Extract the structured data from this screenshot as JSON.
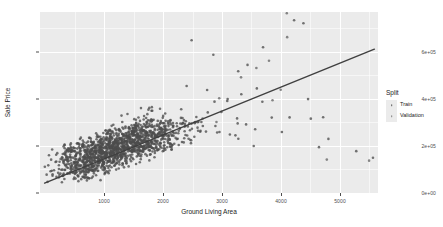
{
  "chart_data": {
    "type": "scatter",
    "title": "",
    "xlabel": "Ground Living Area",
    "ylabel": "Sale Price",
    "xlim": [
      260,
      5700
    ],
    "ylim": [
      0,
      770000
    ],
    "grid": true,
    "x_ticks": [
      1000,
      2000,
      3000,
      4000,
      5000
    ],
    "x_tick_labels": [
      "1000",
      "2000",
      "3000",
      "4000",
      "5000"
    ],
    "x_minor_ticks": [
      500,
      1500,
      2500,
      3500,
      4500,
      5500
    ],
    "y_ticks": [
      0,
      200000,
      400000,
      600000
    ],
    "y_tick_labels": [
      "0e+00",
      "2e+05",
      "4e+05",
      "6e+05"
    ],
    "y_minor_ticks": [
      100000,
      300000,
      500000,
      700000
    ],
    "legend": {
      "title": "Split",
      "position": "right",
      "entries": [
        {
          "label": "Train",
          "color": "#595959",
          "marker": "point"
        },
        {
          "label": "Validation",
          "color": "#7f7f7f",
          "marker": "point"
        }
      ]
    },
    "trend_line": {
      "type": "linear",
      "color": "#404040",
      "x_start": 334,
      "y_start": 42000,
      "x_end": 5642,
      "y_end": 612000
    },
    "point_color": "#4d4d4d",
    "point_size": 1.3,
    "series": [
      {
        "name": "Train",
        "color": "#4d4d4d",
        "points": [
          [
            334,
            40000
          ],
          [
            360,
            55000
          ],
          [
            438,
            60000
          ],
          [
            480,
            68000
          ],
          [
            520,
            76000
          ],
          [
            547,
            82000
          ],
          [
            572,
            88000
          ],
          [
            600,
            72000
          ],
          [
            616,
            95000
          ],
          [
            630,
            101000
          ],
          [
            648,
            86000
          ],
          [
            660,
            112000
          ],
          [
            672,
            97000
          ],
          [
            686,
            120000
          ],
          [
            700,
            105000
          ],
          [
            712,
            130000
          ],
          [
            720,
            90000
          ],
          [
            730,
            115000
          ],
          [
            740,
            126000
          ],
          [
            748,
            108000
          ],
          [
            756,
            137000
          ],
          [
            764,
            119000
          ],
          [
            772,
            143000
          ],
          [
            780,
            95000
          ],
          [
            788,
            128000
          ],
          [
            796,
            152000
          ],
          [
            804,
            110000
          ],
          [
            812,
            135000
          ],
          [
            820,
            122000
          ],
          [
            828,
            148000
          ],
          [
            836,
            113000
          ],
          [
            844,
            160000
          ],
          [
            852,
            131000
          ],
          [
            860,
            102000
          ],
          [
            868,
            142000
          ],
          [
            876,
            155000
          ],
          [
            884,
            124000
          ],
          [
            892,
            118000
          ],
          [
            900,
            137000
          ],
          [
            908,
            165000
          ],
          [
            912,
            109000
          ],
          [
            920,
            129000
          ],
          [
            928,
            146000
          ],
          [
            936,
            133000
          ],
          [
            944,
            158000
          ],
          [
            952,
            120000
          ],
          [
            960,
            142000
          ],
          [
            968,
            171000
          ],
          [
            972,
            115000
          ],
          [
            980,
            136000
          ],
          [
            988,
            151000
          ],
          [
            996,
            127000
          ],
          [
            1004,
            163000
          ],
          [
            1012,
            140000
          ],
          [
            1020,
            122000
          ],
          [
            1028,
            155000
          ],
          [
            1036,
            134000
          ],
          [
            1044,
            168000
          ],
          [
            1052,
            145000
          ],
          [
            1060,
            128000
          ],
          [
            1068,
            159000
          ],
          [
            1076,
            138000
          ],
          [
            1084,
            175000
          ],
          [
            1092,
            147000
          ],
          [
            1100,
            131000
          ],
          [
            1108,
            162000
          ],
          [
            1116,
            142000
          ],
          [
            1124,
            179000
          ],
          [
            1132,
            152000
          ],
          [
            1140,
            135000
          ],
          [
            1148,
            166000
          ],
          [
            1156,
            146000
          ],
          [
            1164,
            185000
          ],
          [
            1172,
            156000
          ],
          [
            1180,
            139000
          ],
          [
            1188,
            170000
          ],
          [
            1196,
            149000
          ],
          [
            1204,
            190000
          ],
          [
            1212,
            160000
          ],
          [
            1220,
            143000
          ],
          [
            1228,
            174000
          ],
          [
            1236,
            153000
          ],
          [
            1244,
            195000
          ],
          [
            1252,
            164000
          ],
          [
            1260,
            147000
          ],
          [
            1268,
            178000
          ],
          [
            1276,
            157000
          ],
          [
            1284,
            199000
          ],
          [
            1292,
            168000
          ],
          [
            1300,
            151000
          ],
          [
            1308,
            182000
          ],
          [
            1316,
            161000
          ],
          [
            1324,
            204000
          ],
          [
            1332,
            172000
          ],
          [
            1340,
            155000
          ],
          [
            1348,
            186000
          ],
          [
            1356,
            165000
          ],
          [
            1364,
            209000
          ],
          [
            1372,
            176000
          ],
          [
            1380,
            159000
          ],
          [
            1388,
            190000
          ],
          [
            1396,
            169000
          ],
          [
            1404,
            214000
          ],
          [
            1412,
            180000
          ],
          [
            1420,
            163000
          ],
          [
            1428,
            194000
          ],
          [
            1436,
            173000
          ],
          [
            1444,
            218000
          ],
          [
            1452,
            184000
          ],
          [
            1460,
            167000
          ],
          [
            1468,
            198000
          ],
          [
            1476,
            177000
          ],
          [
            1484,
            223000
          ],
          [
            1492,
            188000
          ],
          [
            1500,
            171000
          ],
          [
            1508,
            202000
          ],
          [
            1516,
            181000
          ],
          [
            1524,
            228000
          ],
          [
            1532,
            192000
          ],
          [
            1540,
            175000
          ],
          [
            1548,
            206000
          ],
          [
            1556,
            185000
          ],
          [
            1564,
            233000
          ],
          [
            1572,
            196000
          ],
          [
            1580,
            179000
          ],
          [
            1588,
            210000
          ],
          [
            1596,
            189000
          ],
          [
            1604,
            238000
          ],
          [
            1612,
            200000
          ],
          [
            1620,
            183000
          ],
          [
            1628,
            214000
          ],
          [
            1636,
            193000
          ],
          [
            1644,
            242000
          ],
          [
            1652,
            204000
          ],
          [
            1660,
            187000
          ],
          [
            1668,
            218000
          ],
          [
            1676,
            197000
          ],
          [
            1684,
            247000
          ],
          [
            1692,
            208000
          ],
          [
            1700,
            191000
          ],
          [
            1708,
            222000
          ],
          [
            1716,
            201000
          ],
          [
            1724,
            252000
          ],
          [
            1732,
            212000
          ],
          [
            1740,
            195000
          ],
          [
            1748,
            226000
          ],
          [
            1756,
            205000
          ],
          [
            1764,
            257000
          ],
          [
            1772,
            216000
          ],
          [
            1780,
            199000
          ],
          [
            1788,
            230000
          ],
          [
            1796,
            209000
          ],
          [
            1804,
            262000
          ],
          [
            1812,
            220000
          ],
          [
            1820,
            203000
          ],
          [
            1828,
            234000
          ],
          [
            1836,
            213000
          ],
          [
            1844,
            266000
          ],
          [
            1852,
            224000
          ],
          [
            1860,
            207000
          ],
          [
            1868,
            238000
          ],
          [
            1876,
            217000
          ],
          [
            1884,
            271000
          ],
          [
            1892,
            228000
          ],
          [
            1900,
            211000
          ],
          [
            1908,
            242000
          ],
          [
            1916,
            221000
          ],
          [
            1924,
            276000
          ],
          [
            1932,
            232000
          ],
          [
            1940,
            215000
          ],
          [
            1948,
            246000
          ],
          [
            1956,
            225000
          ],
          [
            1964,
            281000
          ],
          [
            1972,
            236000
          ],
          [
            1980,
            219000
          ],
          [
            1988,
            250000
          ],
          [
            1996,
            229000
          ],
          [
            2004,
            286000
          ],
          [
            2012,
            240000
          ],
          [
            2020,
            223000
          ],
          [
            2028,
            254000
          ],
          [
            2036,
            233000
          ],
          [
            2044,
            290000
          ],
          [
            2052,
            244000
          ],
          [
            2060,
            227000
          ],
          [
            2068,
            258000
          ],
          [
            2076,
            237000
          ],
          [
            2084,
            295000
          ],
          [
            2092,
            248000
          ],
          [
            2100,
            231000
          ],
          [
            2120,
            262000
          ],
          [
            2140,
            241000
          ],
          [
            2160,
            300000
          ],
          [
            2180,
            252000
          ],
          [
            2200,
            235000
          ],
          [
            2220,
            266000
          ],
          [
            2240,
            245000
          ],
          [
            2260,
            305000
          ],
          [
            2280,
            256000
          ],
          [
            2300,
            239000
          ],
          [
            2320,
            270000
          ],
          [
            2340,
            249000
          ],
          [
            2360,
            310000
          ],
          [
            2380,
            260000
          ],
          [
            2400,
            243000
          ],
          [
            2420,
            274000
          ],
          [
            2440,
            253000
          ],
          [
            2460,
            314000
          ],
          [
            2480,
            264000
          ],
          [
            2500,
            247000
          ],
          [
            2520,
            278000
          ],
          [
            2540,
            257000
          ],
          [
            2560,
            319000
          ],
          [
            2580,
            268000
          ],
          [
            2600,
            251000
          ],
          [
            2640,
            282000
          ],
          [
            2680,
            261000
          ],
          [
            2720,
            324000
          ],
          [
            2760,
            272000
          ],
          [
            2800,
            255000
          ],
          [
            2840,
            286000
          ],
          [
            2880,
            265000
          ],
          [
            2920,
            329000
          ],
          [
            2960,
            276000
          ],
          [
            3000,
            259000
          ],
          [
            3050,
            290000
          ],
          [
            3100,
            269000
          ],
          [
            3150,
            334000
          ],
          [
            3200,
            280000
          ],
          [
            3250,
            263000
          ],
          [
            3300,
            294000
          ],
          [
            3350,
            273000
          ],
          [
            3400,
            338000
          ],
          [
            3450,
            284000
          ],
          [
            3500,
            267000
          ],
          [
            3600,
            298000
          ],
          [
            3700,
            277000
          ],
          [
            3800,
            343000
          ],
          [
            3900,
            288000
          ],
          [
            4000,
            271000
          ],
          [
            4200,
            302000
          ],
          [
            4400,
            281000
          ],
          [
            4600,
            347000
          ],
          [
            4800,
            292000
          ],
          [
            5000,
            190000
          ],
          [
            5642,
            180000
          ]
        ]
      },
      {
        "name": "Validation",
        "color": "#666666",
        "points": [
          [
            700,
            118000
          ],
          [
            820,
            134000
          ],
          [
            940,
            150000
          ],
          [
            1060,
            144000
          ],
          [
            1180,
            167000
          ],
          [
            1300,
            181000
          ],
          [
            1420,
            176000
          ],
          [
            1540,
            196000
          ],
          [
            1660,
            210000
          ],
          [
            1780,
            205000
          ],
          [
            1900,
            229000
          ],
          [
            2020,
            243000
          ],
          [
            2140,
            238000
          ],
          [
            2260,
            262000
          ],
          [
            2380,
            276000
          ],
          [
            2500,
            271000
          ],
          [
            2700,
            300000
          ],
          [
            2900,
            318000
          ],
          [
            3100,
            420000
          ],
          [
            3300,
            450000
          ],
          [
            3500,
            480000
          ],
          [
            3700,
            520000
          ],
          [
            3900,
            412000
          ],
          [
            4100,
            455000
          ],
          [
            4300,
            720000
          ],
          [
            4500,
            710000
          ],
          [
            4700,
            190000
          ],
          [
            5300,
            175000
          ]
        ]
      }
    ],
    "outliers": [
      [
        4350,
        735000
      ],
      [
        4500,
        722000
      ],
      [
        3850,
        620000
      ],
      [
        2700,
        650000
      ],
      [
        3050,
        588000
      ],
      [
        3600,
        545000
      ],
      [
        3450,
        518000
      ],
      [
        3750,
        445000
      ],
      [
        3500,
        420000
      ],
      [
        2620,
        455000
      ],
      [
        2950,
        438000
      ],
      [
        3280,
        400000
      ],
      [
        4750,
        195000
      ],
      [
        5350,
        178000
      ],
      [
        3700,
        200000
      ],
      [
        3180,
        345000
      ]
    ]
  }
}
